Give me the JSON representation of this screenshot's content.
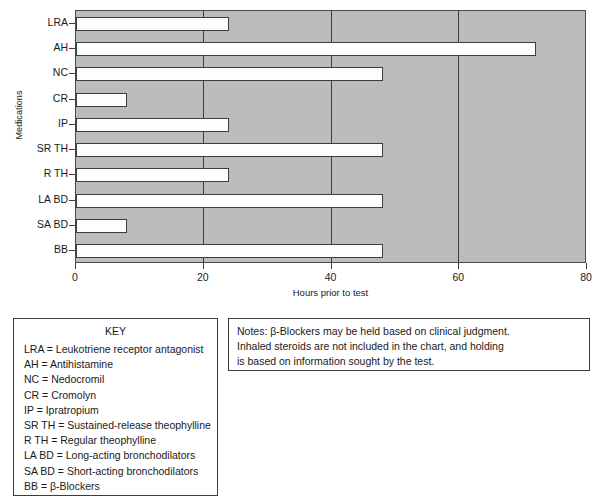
{
  "chart_data": {
    "type": "bar",
    "orientation": "horizontal",
    "title": "",
    "xlabel": "Hours prior to test",
    "ylabel": "Medications",
    "xlim": [
      0,
      80
    ],
    "xticks": [
      0,
      20,
      40,
      60,
      80
    ],
    "gridlines": [
      20,
      40,
      60
    ],
    "grid": true,
    "legend": "none",
    "plot_background": "#bcbcbc",
    "bar_fill": "#fdfdfd",
    "bar_edge": "#3d3d3d",
    "categories": [
      "LRA",
      "AH",
      "NC",
      "CR",
      "IP",
      "SR TH",
      "R TH",
      "LA BD",
      "SA BD",
      "BB"
    ],
    "values": [
      24,
      72,
      48,
      8,
      24,
      48,
      24,
      48,
      8,
      48
    ],
    "units": "hours"
  },
  "key_panel": {
    "title": "KEY",
    "entries": [
      "LRA = Leukotriene receptor antagonist",
      "AH = Antihistamine",
      "NC = Nedocromil",
      "CR = Cromolyn",
      "IP = Ipratropium",
      "SR TH = Sustained-release theophylline",
      "R TH = Regular theophylline",
      "LA BD = Long-acting bronchodilators",
      "SA BD = Short-acting bronchodilators",
      "BB = β-Blockers"
    ]
  },
  "notes_panel": {
    "lines": [
      "Notes: β-Blockers may be held based on clinical judgment.",
      "Inhaled steroids are not included in the chart, and holding",
      "is based on information sought by the test."
    ]
  }
}
